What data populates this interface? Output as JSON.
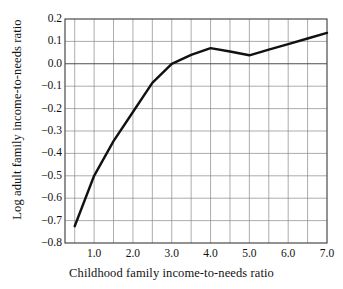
{
  "chart_data": {
    "type": "line",
    "title": "",
    "xlabel": "Childhood family income-to-needs ratio",
    "ylabel": "Log adult family income-to-needs ratio",
    "xlim": [
      0.25,
      7.0
    ],
    "ylim": [
      -0.8,
      0.2
    ],
    "grid": true,
    "legend_position": "none",
    "xticks": [
      "1.0",
      "2.0",
      "3.0",
      "4.0",
      "5.0",
      "6.0",
      "7.0"
    ],
    "xtick_values": [
      1.0,
      2.0,
      3.0,
      4.0,
      5.0,
      6.0,
      7.0
    ],
    "x_minor_step": 0.5,
    "yticks": [
      "0.2",
      "0.1",
      "0.0",
      "−0.1",
      "−0.2",
      "−0.3",
      "−0.4",
      "−0.5",
      "−0.6",
      "−0.7",
      "−0.8"
    ],
    "ytick_values": [
      0.2,
      0.1,
      0.0,
      -0.1,
      -0.2,
      -0.3,
      -0.4,
      -0.5,
      -0.6,
      -0.7,
      -0.8
    ],
    "zero_line": 0.0,
    "series": [
      {
        "name": "Log adult family income-to-needs ratio",
        "color": "#111111",
        "x": [
          0.5,
          1.0,
          1.5,
          2.0,
          2.5,
          3.0,
          3.5,
          4.0,
          4.5,
          5.0,
          5.5,
          6.0,
          6.5,
          7.0
        ],
        "values": [
          -0.725,
          -0.5,
          -0.345,
          -0.215,
          -0.085,
          0.0,
          0.04,
          0.07,
          0.055,
          0.038,
          0.063,
          0.088,
          0.113,
          0.138
        ]
      }
    ],
    "colors": {
      "line": "#111111",
      "grid": "#8a8a8a",
      "axis": "#4a4a4a",
      "zero": "#555555",
      "background": "#ffffff",
      "text": "#111111"
    }
  }
}
